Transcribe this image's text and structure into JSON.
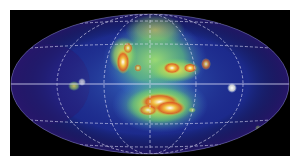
{
  "image": {
    "description": "All-sky map in elliptical (Aitoff) projection showing emission concentrated near the galactic center",
    "projection": "aitoff-ellipse",
    "colors": {
      "background": "#000000",
      "sky_base": "#1c2a8c",
      "sky_dark": "#2a1870",
      "grid": "#e8e8ff",
      "low": "#3a6fd0",
      "mid": "#6fd06a",
      "high": "#f0e050",
      "peak": "#e04020",
      "saturated": "#ffffff"
    },
    "features": [
      {
        "name": "central-upper-left-ridge",
        "level": "peak"
      },
      {
        "name": "central-upper-right-ridge",
        "level": "peak"
      },
      {
        "name": "central-lower-bulge",
        "level": "saturated"
      },
      {
        "name": "right-point-source",
        "level": "saturated"
      },
      {
        "name": "left-equator-source",
        "level": "high"
      },
      {
        "name": "lower-right-faint-source",
        "level": "mid"
      }
    ]
  }
}
